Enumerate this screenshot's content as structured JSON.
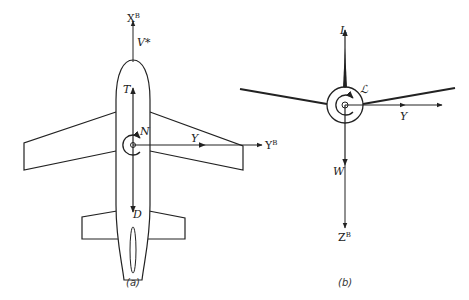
{
  "figure": {
    "panels": [
      {
        "id": "a",
        "caption": "(a)",
        "view": "top view of aircraft",
        "labels": {
          "xb_axis": "X",
          "xb_sup": "B",
          "velocity": "V*",
          "thrust": "T",
          "yaw_moment": "N",
          "side_force": "Y",
          "yb_axis": "Y",
          "yb_sup": "B",
          "drag": "D"
        }
      },
      {
        "id": "b",
        "caption": "(b)",
        "view": "front view of aircraft",
        "labels": {
          "lift": "L",
          "roll_moment": "ℒ",
          "side_force": "Y",
          "weight": "W",
          "zb_axis": "Z",
          "zb_sup": "B"
        }
      }
    ],
    "colors": {
      "stroke": "#222222",
      "background": "#ffffff"
    }
  }
}
